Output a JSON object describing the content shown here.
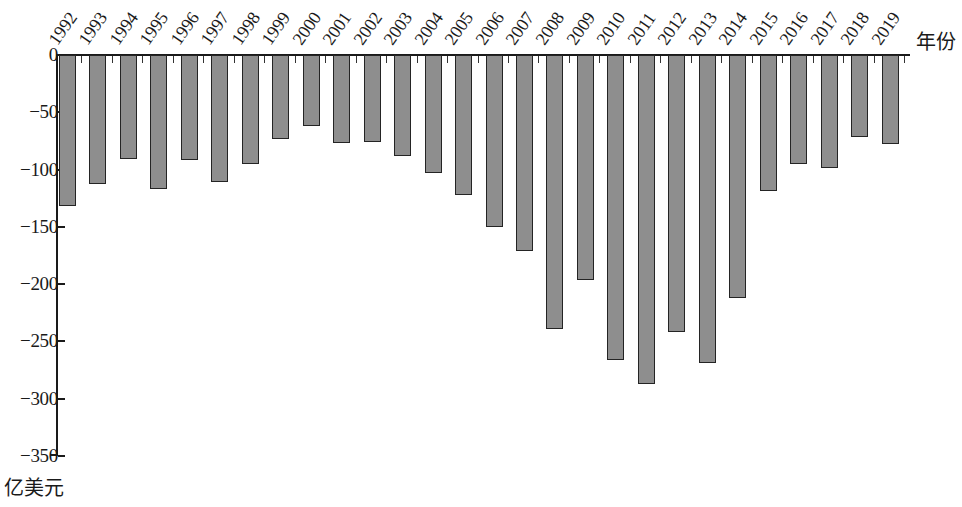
{
  "chart_data": {
    "type": "bar",
    "title": "",
    "subtitle": "",
    "xlabel": "年份",
    "ylabel": "亿美元",
    "categories": [
      "1992",
      "1993",
      "1994",
      "1995",
      "1996",
      "1997",
      "1998",
      "1999",
      "2000",
      "2001",
      "2002",
      "2003",
      "2004",
      "2005",
      "2006",
      "2007",
      "2008",
      "2009",
      "2010",
      "2011",
      "2012",
      "2013",
      "2014",
      "2015",
      "2016",
      "2017",
      "2018",
      "2019"
    ],
    "values": [
      -132,
      -113,
      -91,
      -117,
      -92,
      -111,
      -95,
      -73,
      -62,
      -77,
      -76,
      -88,
      -103,
      -122,
      -150,
      -171,
      -239,
      -196,
      -266,
      -287,
      -242,
      -269,
      -212,
      -119,
      -95,
      -99,
      -72,
      -78
    ],
    "ylim": [
      -350,
      0
    ],
    "yticks": [
      0,
      -50,
      -100,
      -150,
      -200,
      -250,
      -300,
      -350
    ],
    "ytick_labels": [
      "0",
      "−50",
      "−100",
      "−150",
      "−200",
      "−250",
      "−300",
      "−350"
    ],
    "grid": false,
    "legend": null,
    "series_color": "#8e8e8e",
    "series_border_color": "#242424",
    "axis_color": "#1a1a1a"
  }
}
